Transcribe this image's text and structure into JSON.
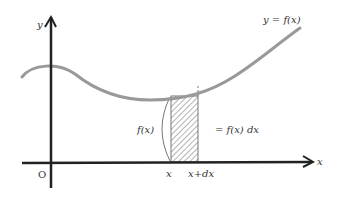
{
  "diagram": {
    "curve_label": "y = f(x)",
    "y_axis_label": "y",
    "x_axis_label": "x",
    "origin_label": "O",
    "height_label": "f(x)",
    "area_label": "= f(x) dx",
    "x_tick_label": "x",
    "x_dx_tick_label": "x+dx",
    "colors": {
      "axis": "#222222",
      "curve": "#999999",
      "hatch": "#666666",
      "text": "#333333"
    }
  }
}
